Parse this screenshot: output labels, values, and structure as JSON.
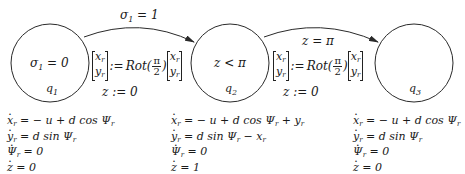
{
  "states": [
    {
      "id": "q1",
      "name": "q",
      "name_sub": "1",
      "invariant": "σ₁ = 0",
      "invariant_parts": {
        "lhs": "σ",
        "sub": "1",
        "rest": " = 0"
      },
      "center": [
        50,
        63
      ],
      "radius": 39,
      "flow": [
        "ẋr = − u + d cos Ψr",
        "ẏr = d sin Ψr",
        "Ψ̇r = 0",
        "ż = 0"
      ]
    },
    {
      "id": "q2",
      "name": "q",
      "name_sub": "2",
      "invariant": "z < π",
      "center": [
        230,
        63
      ],
      "radius": 39,
      "flow": [
        "ẋr = − u + d cos Ψr + yr",
        "ẏr = d sin Ψr − xr",
        "Ψ̇r = 0",
        "ż = 1"
      ]
    },
    {
      "id": "q3",
      "name": "q",
      "name_sub": "3",
      "invariant": "",
      "center": [
        414,
        63
      ],
      "radius": 39,
      "flow": [
        "ẋr = − u + d cos Ψr",
        "ẏr = d sin Ψr",
        "Ψ̇r = 0",
        "ż = 0"
      ]
    }
  ],
  "transitions": [
    {
      "from": "q1",
      "to": "q2",
      "guard": "σ₁ = 1",
      "guard_parts": {
        "lhs": "σ",
        "sub": "1",
        "rest": " = 1"
      },
      "reset_assign": ":=",
      "reset_fn": "Rot(",
      "reset_fn_close": ")",
      "frac_num": "π",
      "frac_den": "2",
      "vec_top": "x",
      "vec_bot": "y",
      "vec_sub": "r",
      "reset_z": "z := 0"
    },
    {
      "from": "q2",
      "to": "q3",
      "guard": "z = π",
      "reset_assign": ":=",
      "reset_fn": "Rot(",
      "reset_fn_close": ")",
      "frac_num": "π",
      "frac_den": "2",
      "vec_top": "x",
      "vec_bot": "y",
      "vec_sub": "r",
      "reset_z": "z := 0"
    }
  ],
  "flow_text": {
    "q1": {
      "l1": {
        "a": "x",
        "b": "r",
        "c": " = − u + d cos Ψ",
        "d": "r"
      },
      "l2": {
        "a": "y",
        "b": "r",
        "c": " = d sin Ψ",
        "d": "r"
      },
      "l3": {
        "a": "Ψ",
        "b": "r",
        "c": " = 0"
      },
      "l4": {
        "a": "z",
        "c": " = 0"
      }
    },
    "q2": {
      "l1": {
        "a": "x",
        "b": "r",
        "c": " = − u + d cos Ψ",
        "d": "r",
        "e": " + y",
        "f": "r"
      },
      "l2": {
        "a": "y",
        "b": "r",
        "c": " = d sin Ψ",
        "d": "r",
        "e": " − x",
        "f": "r"
      },
      "l3": {
        "a": "Ψ",
        "b": "r",
        "c": " = 0"
      },
      "l4": {
        "a": "z",
        "c": " = 1"
      }
    },
    "q3": {
      "l1": {
        "a": "x",
        "b": "r",
        "c": " = − u + d cos Ψ",
        "d": "r"
      },
      "l2": {
        "a": "y",
        "b": "r",
        "c": " = d sin Ψ",
        "d": "r"
      },
      "l3": {
        "a": "Ψ",
        "b": "r",
        "c": " = 0"
      },
      "l4": {
        "a": "z",
        "c": " = 0"
      }
    }
  },
  "colors": {
    "stroke": "#2a2a2a",
    "text": "#1a1a1a",
    "background": "#ffffff"
  }
}
